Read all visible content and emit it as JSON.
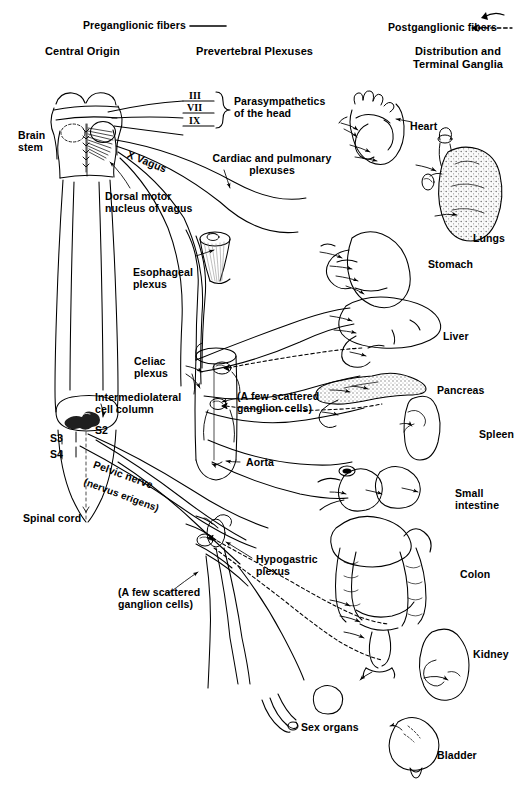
{
  "figure": {
    "legend": {
      "preganglionic_label": "Preganglionic fibers",
      "preganglionic_symbol": "solid-line",
      "postganglionic_label": "Postganglionic fibers",
      "postganglionic_symbol": "diamond-dashed-line",
      "terminal_arrow_symbol": "arrow-hook-icon"
    },
    "columns": [
      {
        "id": "central-origin",
        "label": "Central Origin"
      },
      {
        "id": "prevertebral-plexuses",
        "label": "Prevertebral Plexuses"
      },
      {
        "id": "distribution",
        "label": "Distribution and\nTerminal Ganglia"
      }
    ],
    "cranial_nerves": [
      "III",
      "VII",
      "IX"
    ],
    "cranial_nerve_group_label": "Parasympathetics\nof the head",
    "vagus_label": "X Vagus",
    "central_labels": [
      {
        "id": "brain-stem",
        "text": "Brain\nstem"
      },
      {
        "id": "dorsal-motor-nucleus",
        "text": "Dorsal motor\nnucleus of vagus"
      },
      {
        "id": "intermediolateral-cell-column",
        "text": "Intermediolateral\ncell column"
      },
      {
        "id": "segment-s2",
        "text": "S2"
      },
      {
        "id": "segment-s3",
        "text": "S3"
      },
      {
        "id": "segment-s4",
        "text": "S4"
      },
      {
        "id": "pelvic-nerve",
        "text": "Pelvic nerve"
      },
      {
        "id": "nervus-erigens",
        "text": "(nervus erigens)"
      },
      {
        "id": "spinal-cord",
        "text": "Spinal cord"
      }
    ],
    "plexus_labels": [
      {
        "id": "cardiac-pulmonary-plexuses",
        "text": "Cardiac and pulmonary\nplexuses"
      },
      {
        "id": "esophageal-plexus",
        "text": "Esophageal\nplexus"
      },
      {
        "id": "celiac-plexus",
        "text": "Celiac\nplexus"
      },
      {
        "id": "scattered-ganglion-cells-upper",
        "text": "(A few scattered\nganglion cells)"
      },
      {
        "id": "aorta",
        "text": "Aorta"
      },
      {
        "id": "hypogastric-plexus",
        "text": "Hypogastric\nplexus"
      },
      {
        "id": "scattered-ganglion-cells-lower",
        "text": "(A few scattered\nganglion cells)"
      }
    ],
    "organs": [
      {
        "id": "heart",
        "label": "Heart"
      },
      {
        "id": "lungs",
        "label": "Lungs"
      },
      {
        "id": "stomach",
        "label": "Stomach"
      },
      {
        "id": "liver",
        "label": "Liver"
      },
      {
        "id": "pancreas",
        "label": "Pancreas"
      },
      {
        "id": "spleen",
        "label": "Spleen"
      },
      {
        "id": "small-intestine",
        "label": "Small\nintestine"
      },
      {
        "id": "colon",
        "label": "Colon"
      },
      {
        "id": "kidney",
        "label": "Kidney"
      },
      {
        "id": "sex-organs",
        "label": "Sex organs"
      },
      {
        "id": "bladder",
        "label": "Bladder"
      }
    ],
    "colors": {
      "ink": "#000000",
      "paper": "#ffffff",
      "tissue_fill": "#f2f2f2",
      "stipple": "#8a8a8a"
    }
  }
}
